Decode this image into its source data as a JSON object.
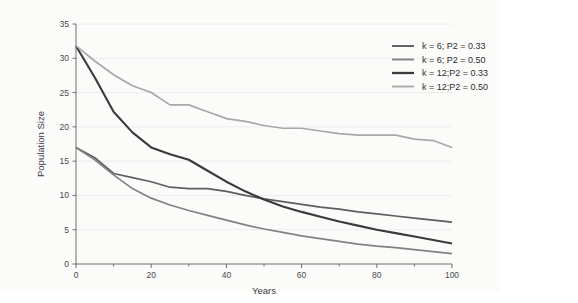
{
  "figure": {
    "background_color": "#fbfbfa",
    "page_color": "#ffffff"
  },
  "chart_data": {
    "type": "line",
    "title": "",
    "xlabel": "Years",
    "ylabel": "Population Size",
    "xlim": [
      0,
      100
    ],
    "ylim": [
      0,
      35
    ],
    "xticks": [
      0,
      20,
      40,
      60,
      80,
      100
    ],
    "xtick_labels": [
      "0",
      "20",
      "40",
      "60",
      "80",
      "100"
    ],
    "xminor_ticks": [
      10,
      30,
      50,
      70,
      90
    ],
    "yticks": [
      0,
      5,
      10,
      15,
      20,
      25,
      30,
      35
    ],
    "ytick_labels": [
      "0",
      "5",
      "10",
      "15",
      "20",
      "25",
      "30",
      "35"
    ],
    "grid": "horizontal-faint",
    "grid_color": "#ececec",
    "legend_position": "top-right",
    "x": [
      0,
      5,
      10,
      15,
      20,
      25,
      30,
      35,
      40,
      45,
      50,
      55,
      60,
      65,
      70,
      75,
      80,
      85,
      90,
      95,
      100
    ],
    "series": [
      {
        "name": "k = 6; P2 = 0.33",
        "color": "#5e5e5e",
        "width": 1.7,
        "values": [
          17.0,
          15.5,
          13.2,
          12.6,
          12.0,
          11.2,
          11.0,
          11.0,
          10.6,
          10.0,
          9.5,
          9.1,
          8.7,
          8.3,
          8.0,
          7.6,
          7.3,
          7.0,
          6.7,
          6.4,
          6.1
        ]
      },
      {
        "name": "k = 6; P2 = 0.50",
        "color": "#828282",
        "width": 1.7,
        "values": [
          17.0,
          15.2,
          13.0,
          11.0,
          9.6,
          8.6,
          7.8,
          7.1,
          6.4,
          5.7,
          5.1,
          4.6,
          4.1,
          3.7,
          3.3,
          2.9,
          2.6,
          2.4,
          2.1,
          1.8,
          1.5
        ]
      },
      {
        "name": "k = 12;P2 = 0.33",
        "color": "#3a3a3a",
        "width": 2.1,
        "values": [
          31.8,
          27.2,
          22.2,
          19.2,
          17.0,
          16.0,
          15.2,
          13.6,
          12.0,
          10.6,
          9.4,
          8.4,
          7.6,
          6.9,
          6.2,
          5.6,
          5.0,
          4.5,
          4.0,
          3.5,
          3.0
        ]
      },
      {
        "name": "k = 12;P2 = 0.50",
        "color": "#a8a8a8",
        "width": 1.7,
        "values": [
          31.8,
          29.6,
          27.6,
          26.0,
          25.0,
          23.2,
          23.2,
          22.2,
          21.2,
          20.8,
          20.2,
          19.8,
          19.8,
          19.4,
          19.0,
          18.8,
          18.8,
          18.8,
          18.2,
          18.0,
          17.0
        ]
      }
    ]
  },
  "legend": {
    "items": [
      {
        "label": "k = 6; P2 = 0.33",
        "color": "#5e5e5e"
      },
      {
        "label": "k = 6; P2 = 0.50",
        "color": "#828282"
      },
      {
        "label": "k = 12;P2 = 0.33",
        "color": "#3a3a3a"
      },
      {
        "label": "k = 12;P2 = 0.50",
        "color": "#a8a8a8"
      }
    ]
  }
}
